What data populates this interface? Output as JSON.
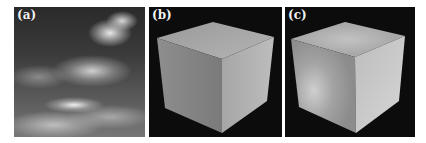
{
  "figure": {
    "panels": [
      {
        "label": "(a)",
        "content": "cloudy sky texture"
      },
      {
        "label": "(b)",
        "content": "uniformly shaded cube"
      },
      {
        "label": "(c)",
        "content": "cube shaded with cloud illumination"
      }
    ]
  }
}
